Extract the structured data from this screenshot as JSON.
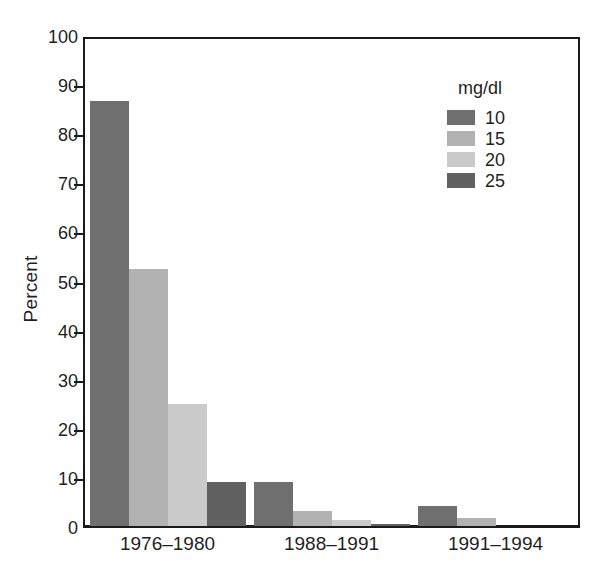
{
  "chart_data": {
    "type": "bar",
    "title": "",
    "subtitle": "",
    "xlabel": "",
    "ylabel": "Percent",
    "categories": [
      "1976–1980",
      "1988–1991",
      "1991–1994"
    ],
    "series": [
      {
        "name": "10",
        "values": [
          87,
          9,
          4
        ]
      },
      {
        "name": "15",
        "values": [
          52.5,
          3,
          1.7
        ]
      },
      {
        "name": "20",
        "values": [
          25,
          1.3,
          0
        ]
      },
      {
        "name": "25",
        "values": [
          9,
          0.4,
          0
        ]
      }
    ],
    "ylim": [
      0,
      100
    ],
    "yticks": [
      0,
      10,
      20,
      30,
      40,
      50,
      60,
      70,
      80,
      90,
      100
    ],
    "ytick_labels": [
      "0",
      "10",
      "20",
      "30",
      "40",
      "50",
      "60",
      "70",
      "80",
      "90",
      "100"
    ],
    "grid": false,
    "legend": {
      "title": "mg/dl",
      "position": "top-right",
      "entries": [
        {
          "label": "10",
          "color": "#6f6f6f"
        },
        {
          "label": "15",
          "color": "#b2b2b2"
        },
        {
          "label": "20",
          "color": "#cacaca"
        },
        {
          "label": "25",
          "color": "#616161"
        }
      ]
    },
    "colors": [
      "#6f6f6f",
      "#b2b2b2",
      "#cacaca",
      "#616161"
    ],
    "axis_color": "#1a1a1a",
    "background": "#ffffff"
  }
}
